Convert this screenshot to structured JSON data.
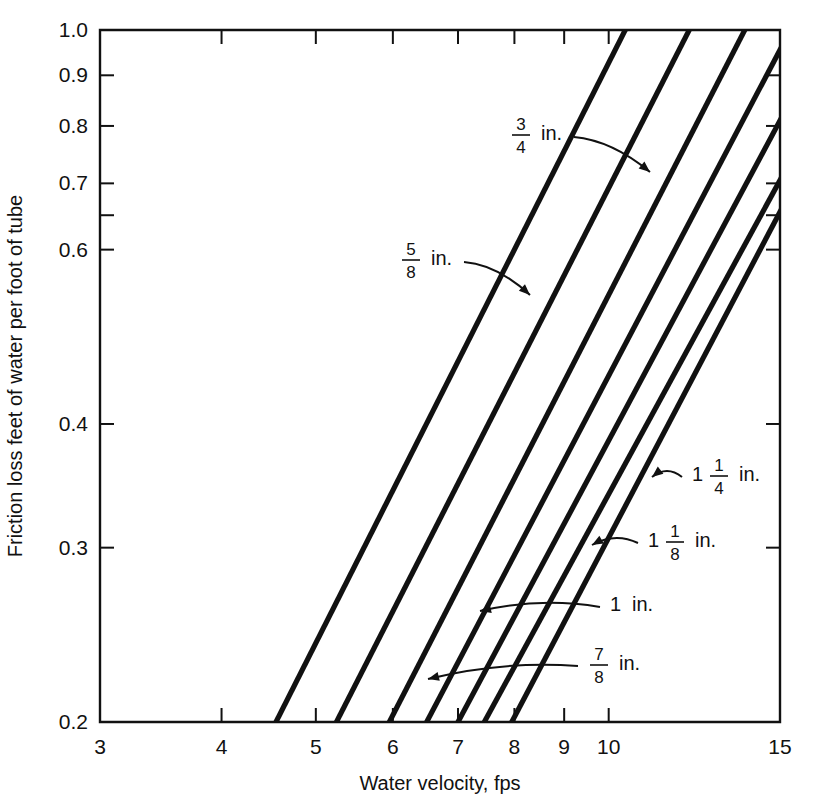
{
  "chart_data": {
    "type": "line",
    "title": "",
    "subtitle": "",
    "xlabel": "Water velocity, fps",
    "ylabel": "Friction loss feet of water per foot of tube",
    "xscale": "log",
    "yscale": "log",
    "xlim": [
      3,
      15
    ],
    "ylim": [
      0.2,
      1.0
    ],
    "grid": false,
    "legend_position": "inline-annotations",
    "x_ticks": [
      {
        "value": 3,
        "label": "3"
      },
      {
        "value": 4,
        "label": "4"
      },
      {
        "value": 5,
        "label": "5"
      },
      {
        "value": 6,
        "label": "6"
      },
      {
        "value": 7,
        "label": "7"
      },
      {
        "value": 8,
        "label": "8"
      },
      {
        "value": 9,
        "label": "9"
      },
      {
        "value": 10,
        "label": "10"
      },
      {
        "value": 15,
        "label": "15"
      }
    ],
    "y_ticks": [
      {
        "value": 1.0,
        "label": "1.0"
      },
      {
        "value": 0.9,
        "label": "0.9"
      },
      {
        "value": 0.8,
        "label": "0.8"
      },
      {
        "value": 0.7,
        "label": "0.7"
      },
      {
        "value": 0.65,
        "label": ""
      },
      {
        "value": 0.6,
        "label": "0.6"
      },
      {
        "value": 0.4,
        "label": "0.4"
      },
      {
        "value": 0.3,
        "label": "0.3"
      },
      {
        "value": 0.2,
        "label": "0.2"
      }
    ],
    "series": [
      {
        "name": "5/8 in.",
        "label_whole": "",
        "label_num": "5",
        "label_den": "8",
        "label_unit": "in.",
        "points": [
          [
            4.55,
            0.2
          ],
          [
            10.4,
            1.0
          ]
        ]
      },
      {
        "name": "3/4 in.",
        "label_whole": "",
        "label_num": "3",
        "label_den": "4",
        "label_unit": "in.",
        "points": [
          [
            5.25,
            0.2
          ],
          [
            12.1,
            1.0
          ]
        ]
      },
      {
        "name": "7/8 in.",
        "label_whole": "",
        "label_num": "7",
        "label_den": "8",
        "label_unit": "in.",
        "points": [
          [
            5.95,
            0.2
          ],
          [
            13.8,
            1.0
          ]
        ]
      },
      {
        "name": "1 in.",
        "label_whole": "1",
        "label_num": "",
        "label_den": "",
        "label_unit": "in.",
        "points": [
          [
            6.5,
            0.2
          ],
          [
            15.0,
            0.955
          ]
        ]
      },
      {
        "name": "1 1/8 in.",
        "label_whole": "1",
        "label_num": "1",
        "label_den": "8",
        "label_unit": "in.",
        "points": [
          [
            7.0,
            0.2
          ],
          [
            15.0,
            0.81
          ]
        ]
      },
      {
        "name": "1 1/4 in.",
        "label_whole": "1",
        "label_num": "1",
        "label_den": "4",
        "label_unit": "in.",
        "points": [
          [
            7.45,
            0.2
          ],
          [
            15.0,
            0.705
          ]
        ]
      },
      {
        "name": "1 1/4 in. lower",
        "label_whole": "",
        "label_num": "",
        "label_den": "",
        "label_unit": "",
        "points": [
          [
            7.95,
            0.2
          ],
          [
            15.0,
            0.655
          ]
        ]
      }
    ],
    "annotations": [
      {
        "id": "a34",
        "text": "3/4 in.",
        "x_text": 510,
        "y_text": 133,
        "target_x": 650,
        "target_y": 172
      },
      {
        "id": "a58",
        "text": "5/8 in.",
        "x_text": 400,
        "y_text": 258,
        "target_x": 530,
        "target_y": 295
      },
      {
        "id": "a114",
        "text": "1 1/4 in.",
        "x_text": 692,
        "y_text": 474,
        "target_x": 652,
        "target_y": 477
      },
      {
        "id": "a118",
        "text": "1 1/8 in.",
        "x_text": 648,
        "y_text": 540,
        "target_x": 592,
        "target_y": 545
      },
      {
        "id": "a1",
        "text": "1 in.",
        "x_text": 610,
        "y_text": 604,
        "target_x": 480,
        "target_y": 611
      },
      {
        "id": "a78",
        "text": "7/8 in.",
        "x_text": 588,
        "y_text": 663,
        "target_x": 428,
        "target_y": 679
      }
    ]
  },
  "axes": {
    "x_title": "Water velocity, fps",
    "y_title": "Friction loss feet of water per foot of tube"
  }
}
